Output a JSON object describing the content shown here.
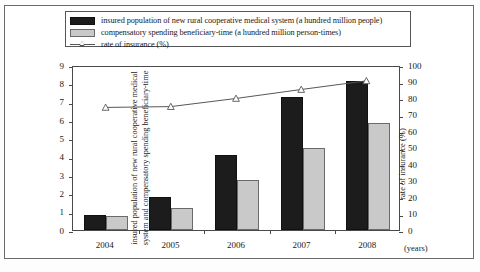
{
  "legend": {
    "items": [
      {
        "key": "black-square-swatch",
        "label": "insured population of new rural cooperative medical system (a hundred million people)"
      },
      {
        "key": "gray-square-swatch",
        "label": "compensatory spending beneficiary-time (a hundred million person-times)"
      },
      {
        "key": "line-triangle-marker",
        "label": "rate of insurance (%)"
      }
    ]
  },
  "axes": {
    "left_title": "insured population of new rural cooperative medical system and compensatory spending beneficiary-time",
    "right_title": "rate of insurance (%)",
    "x_unit": "(years)",
    "left_ticks": [
      "0",
      "1",
      "2",
      "3",
      "4",
      "5",
      "6",
      "7",
      "8",
      "9"
    ],
    "right_ticks": [
      "0",
      "10",
      "20",
      "30",
      "40",
      "50",
      "60",
      "70",
      "80",
      "90",
      "100"
    ]
  },
  "caption": {
    "cut_text": ""
  },
  "chart_data": {
    "type": "bar",
    "title": "",
    "categories": [
      "2004",
      "2005",
      "2006",
      "2007",
      "2008"
    ],
    "xlabel": "(years)",
    "ylabel": "insured population of new rural cooperative medical system and compensatory spending beneficiary-time",
    "ylim": [
      0,
      9
    ],
    "y2label": "rate of insurance (%)",
    "y2lim": [
      0,
      100
    ],
    "grid": false,
    "legend_position": "top",
    "series": [
      {
        "name": "insured population of new rural cooperative medical system (a hundred million people)",
        "type": "bar",
        "axis": "left",
        "color": "#1c1c1c",
        "values": [
          0.8,
          1.79,
          4.1,
          7.26,
          8.15
        ]
      },
      {
        "name": "compensatory spending beneficiary-time (a hundred million person-times)",
        "type": "bar",
        "axis": "left",
        "color": "#c9c9c9",
        "values": [
          0.76,
          1.22,
          2.72,
          4.45,
          5.85
        ]
      },
      {
        "name": "rate of insurance (%)",
        "type": "line",
        "axis": "right",
        "color": "#555555",
        "marker": "triangle",
        "values": [
          75.2,
          75.7,
          80.7,
          86.2,
          91.5
        ]
      }
    ]
  }
}
